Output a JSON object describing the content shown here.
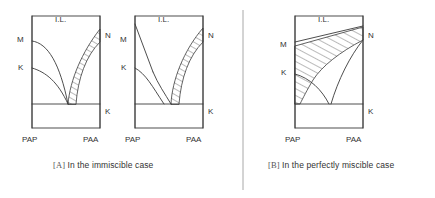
{
  "figure": {
    "title": "",
    "divider": {
      "present": true,
      "x": 243,
      "y1": 10,
      "y2": 190,
      "color": "#9a9a9a"
    }
  },
  "panels": [
    {
      "id": "A",
      "caption_bracket": "[A]",
      "caption_text": "In the immiscible case",
      "diagrams": [
        {
          "id": "A1",
          "region_label": "I.L.",
          "left_axis_labels": [
            "M",
            "K"
          ],
          "right_axis_labels": [
            "N",
            "K"
          ],
          "x_axis_labels": [
            "PAP",
            "PAA"
          ],
          "left_boundary_type": "curved",
          "hatched": true
        },
        {
          "id": "A2",
          "region_label": "I.L.",
          "left_axis_labels": [
            "M",
            "K"
          ],
          "right_axis_labels": [
            "N",
            "K"
          ],
          "x_axis_labels": [
            "PAP",
            "PAA"
          ],
          "left_boundary_type": "straight",
          "hatched": true
        }
      ]
    },
    {
      "id": "B",
      "caption_bracket": "[B]",
      "caption_text": "In the perfectly miscible case",
      "diagrams": [
        {
          "id": "B1",
          "region_label": "I.L.",
          "left_axis_labels": [
            "M",
            "K"
          ],
          "right_axis_labels": [
            "N",
            "K"
          ],
          "x_axis_labels": [
            "PAP",
            "PAA"
          ],
          "left_boundary_type": "wide-hatch",
          "hatched": true
        }
      ]
    }
  ],
  "colors": {
    "line": "#3a3a3a",
    "hatch": "#3a3a3a",
    "text": "#333333",
    "divider": "#a0a0a0"
  }
}
